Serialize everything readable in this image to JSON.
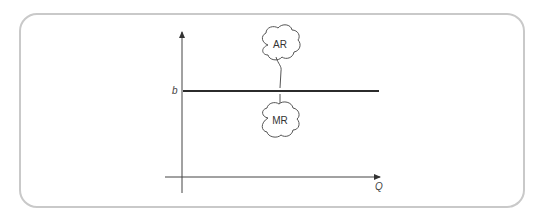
{
  "diagram": {
    "type": "economics-demand-curve",
    "y_axis_tick_label": "b",
    "x_axis_label": "Q",
    "horizontal_line_label_top": "AR",
    "horizontal_line_label_bottom": "MR",
    "line_color": "#2b2b2b",
    "frame_color": "#c9c9c9"
  }
}
